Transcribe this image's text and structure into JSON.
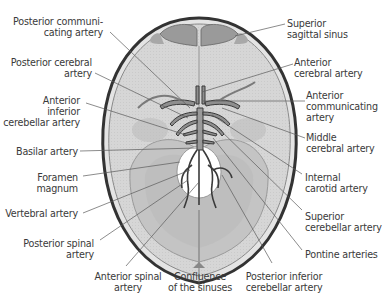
{
  "figure": {
    "type": "anatomical illustration"
  },
  "labels_left": [
    {
      "id": "posterior-communicating-artery",
      "text": "Posterior communi-\ncating artery"
    },
    {
      "id": "posterior-cerebral-artery",
      "text": "Posterior cerebral\nartery"
    },
    {
      "id": "anterior-inferior-cerebellar-artery",
      "text": "Anterior\ninferior\ncerebellar artery"
    },
    {
      "id": "basilar-artery",
      "text": "Basilar artery"
    },
    {
      "id": "foramen-magnum",
      "text": "Foramen\nmagnum"
    },
    {
      "id": "vertebral-artery",
      "text": "Vertebral artery"
    },
    {
      "id": "posterior-spinal-artery",
      "text": "Posterior spinal\nartery"
    }
  ],
  "labels_right": [
    {
      "id": "superior-sagittal-sinus",
      "text": "Superior\nsagittal sinus"
    },
    {
      "id": "anterior-cerebral-artery",
      "text": "Anterior\ncerebral artery"
    },
    {
      "id": "anterior-communicating-artery",
      "text": "Anterior\ncommunicating\nartery"
    },
    {
      "id": "middle-cerebral-artery",
      "text": "Middle\ncerebral artery"
    },
    {
      "id": "internal-carotid-artery",
      "text": "Internal\ncarotid artery"
    },
    {
      "id": "superior-cerebellar-artery",
      "text": "Superior\ncerebellar artery"
    },
    {
      "id": "pontine-arteries",
      "text": "Pontine arteries"
    }
  ],
  "labels_bottom": [
    {
      "id": "anterior-spinal-artery",
      "text": "Anterior spinal\nartery"
    },
    {
      "id": "confluence-of-the-sinuses",
      "text": "Confluence\nof the sinuses"
    },
    {
      "id": "posterior-inferior-cerebellar-artery",
      "text": "Posterior inferior\ncerebellar artery"
    }
  ],
  "colors": {
    "skull_fill": "#dcdcdc",
    "brain_fill": "#cfcfcf",
    "outline": "#3c3c3c",
    "leader": "#5a5a5a",
    "text": "#3a3a3a",
    "foramen": "#ffffff"
  }
}
